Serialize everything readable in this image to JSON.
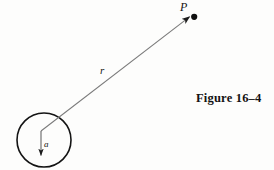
{
  "figure": {
    "caption": "Figure  16–4",
    "background_color": "#fdfdfc",
    "ink_color": "#131313",
    "line_color": "#6b6b6b",
    "labels": {
      "point_p": "P",
      "radial_distance": "r",
      "sphere_radius": "a"
    },
    "geometry": {
      "circle": {
        "cx": 44,
        "cy": 140,
        "r": 27
      },
      "center_point": {
        "x": 41,
        "y": 131
      },
      "field_point": {
        "x": 194,
        "y": 17
      },
      "radius_arrow": {
        "x1": 41,
        "y1": 131,
        "x2": 41,
        "y2": 159
      },
      "r_vector": {
        "x1": 41,
        "y1": 131,
        "x2": 192,
        "y2": 18
      }
    }
  }
}
